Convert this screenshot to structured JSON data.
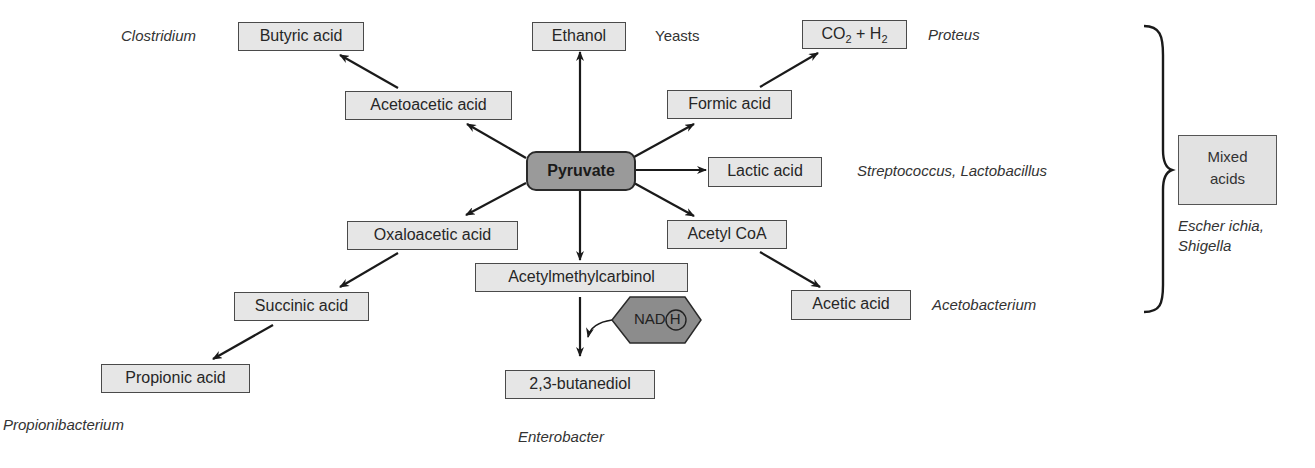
{
  "diagram": {
    "center": {
      "label": "Pyruvate"
    },
    "products": {
      "butyric": {
        "label": "Butyric acid",
        "organism": "Clostridium"
      },
      "acetoacetic": {
        "label": "Acetoacetic acid"
      },
      "ethanol": {
        "label": "Ethanol",
        "organism": "Yeasts"
      },
      "formic": {
        "label": "Formic acid"
      },
      "co2h2": {
        "label_parts": [
          "CO",
          "2",
          " + H",
          "2"
        ],
        "organism": "Proteus"
      },
      "lactic": {
        "label": "Lactic acid",
        "organism": "Streptococcus, Lactobacillus"
      },
      "oxaloacetic": {
        "label": "Oxaloacetic acid"
      },
      "succinic": {
        "label": "Succinic acid"
      },
      "propionic": {
        "label": "Propionic acid",
        "organism": "Propionibacterium"
      },
      "acetylmethylcarbinol": {
        "label": "Acetylmethylcarbinol"
      },
      "butanediol": {
        "label": "2,3-butanediol",
        "organism": "Enterobacter"
      },
      "acetylcoa": {
        "label": "Acetyl CoA"
      },
      "acetic": {
        "label": "Acetic acid",
        "organism": "Acetobacterium"
      }
    },
    "cofactor": {
      "label": "NAD",
      "circled": "H"
    },
    "mixed_acids": {
      "line1": "Mixed",
      "line2": "acids",
      "organism_line1": "Escher ichia,",
      "organism_line2": "Shigella"
    },
    "colors": {
      "box_fill": "#e6e6e6",
      "pyruvate_fill": "#9a9a9a",
      "nad_fill": "#8c8c8c",
      "stroke": "#222222"
    }
  }
}
